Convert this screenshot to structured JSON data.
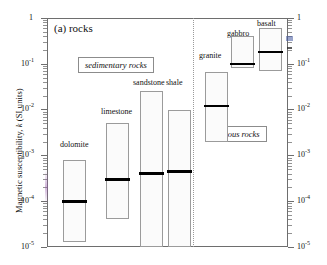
{
  "figure": {
    "panel_title": "(a) rocks",
    "y_axis_label_prefix": "Magnetic susceptibility, ",
    "y_axis_label_italic": "k",
    "y_axis_label_suffix": " (SI units)"
  },
  "groups": [
    {
      "id": "sedimentary",
      "label": "sedimentary rocks"
    },
    {
      "id": "igneous",
      "label": "igneous rocks"
    }
  ],
  "axis": {
    "labels": [
      "1",
      "-1",
      "-2",
      "-3",
      "-4",
      "-5"
    ],
    "left_ticks": [
      "1",
      "10",
      "10",
      "10",
      "10",
      "10"
    ],
    "right_ticks": [
      "1",
      "10",
      "10",
      "10",
      "10",
      "10"
    ]
  },
  "chart_data": {
    "type": "bar",
    "title": "(a) rocks",
    "xlabel": "",
    "ylabel": "Magnetic susceptibility, k (SI units)",
    "yscale": "log",
    "ylim": [
      1e-05,
      1
    ],
    "ytick_values": [
      1,
      0.1,
      0.01,
      0.001,
      0.0001,
      1e-05
    ],
    "ytick_labels": [
      "1",
      "10^-1",
      "10^-2",
      "10^-3",
      "10^-4",
      "10^-5"
    ],
    "grid": false,
    "legend": "none",
    "value_kind": "range-with-mean",
    "units": "SI (dimensionless volume susceptibility)",
    "categories": [
      "dolomite",
      "limestone",
      "sandstone",
      "shale",
      "granite",
      "gabbro",
      "basalt"
    ],
    "groups": {
      "sedimentary": [
        "dolomite",
        "limestone",
        "sandstone",
        "shale"
      ],
      "igneous": [
        "granite",
        "gabbro",
        "basalt"
      ]
    },
    "bars": [
      {
        "name": "dolomite",
        "group": "sedimentary",
        "min": 1.3e-05,
        "max": 0.0008,
        "mean": 0.0001
      },
      {
        "name": "limestone",
        "group": "sedimentary",
        "min": 4e-05,
        "max": 0.005,
        "mean": 0.0003
      },
      {
        "name": "sandstone",
        "group": "sedimentary",
        "min": 1e-05,
        "max": 0.025,
        "mean": 0.0004
      },
      {
        "name": "shale",
        "group": "sedimentary",
        "min": 1e-05,
        "max": 0.01,
        "mean": 0.00045
      },
      {
        "name": "granite",
        "group": "igneous",
        "min": 0.002,
        "max": 0.065,
        "mean": 0.012
      },
      {
        "name": "gabbro",
        "group": "igneous",
        "min": 0.08,
        "max": 0.4,
        "mean": 0.1
      },
      {
        "name": "basalt",
        "group": "igneous",
        "min": 0.07,
        "max": 0.6,
        "mean": 0.18
      }
    ],
    "annotations": [
      {
        "text": "sedimentary rocks",
        "kind": "group-box"
      },
      {
        "text": "igneous rocks",
        "kind": "group-box"
      }
    ]
  },
  "colors": {
    "axis": "#6e6e6e",
    "bar_border": "#9b9b9b",
    "bar_fill": "#fbfbfb",
    "bar_stipple": "#c0c0c0",
    "mean_line": "#000000",
    "divider": "#9a9a9a",
    "text": "#111111"
  }
}
